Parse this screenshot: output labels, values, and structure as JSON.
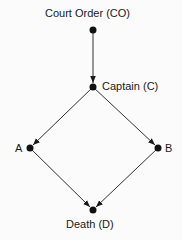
{
  "diagram": {
    "type": "causal-graph",
    "nodes": [
      {
        "id": "CO",
        "label": "Court Order (CO)"
      },
      {
        "id": "C",
        "label": "Captain (C)"
      },
      {
        "id": "A",
        "label": "A"
      },
      {
        "id": "B",
        "label": "B"
      },
      {
        "id": "D",
        "label": "Death (D)"
      }
    ],
    "edges": [
      {
        "from": "CO",
        "to": "C"
      },
      {
        "from": "C",
        "to": "A"
      },
      {
        "from": "C",
        "to": "B"
      },
      {
        "from": "A",
        "to": "D"
      },
      {
        "from": "B",
        "to": "D"
      }
    ]
  }
}
